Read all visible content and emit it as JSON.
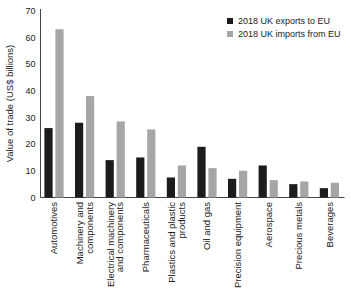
{
  "figure": {
    "ylabel": "Value of trade (US$ billions)"
  },
  "chart_data": {
    "type": "bar",
    "title": "",
    "xlabel": "",
    "ylabel": "Value of trade (US$ billions)",
    "ylim": [
      0,
      70
    ],
    "yticks": [
      0,
      10,
      20,
      30,
      40,
      50,
      60,
      70
    ],
    "grid": false,
    "legend_position": "top-right",
    "axis_color": "#444444",
    "text_color": "#222222",
    "categories": [
      "Automotives",
      "Machinery and components",
      "Electrical machinery and components",
      "Pharmaceuticals",
      "Plastics and plastic products",
      "Oil and gas",
      "Precision equipment",
      "Aerospace",
      "Precious metals",
      "Beverages"
    ],
    "category_label_lines": [
      [
        "Automotives"
      ],
      [
        "Machinery and",
        "components"
      ],
      [
        "Electrical machinery",
        "and components"
      ],
      [
        "Pharmaceuticals"
      ],
      [
        "Plastics and plastic",
        "products"
      ],
      [
        "Oil and gas"
      ],
      [
        "Precision equipment"
      ],
      [
        "Aerospace"
      ],
      [
        "Precious metals"
      ],
      [
        "Beverages"
      ]
    ],
    "series": [
      {
        "name": "2018 UK exports to EU",
        "color": "#1c1c1c",
        "values": [
          26,
          28,
          14,
          15,
          7.5,
          19,
          7,
          12,
          5,
          3.5
        ]
      },
      {
        "name": "2018 UK imports from EU",
        "color": "#a7a5a6",
        "values": [
          63,
          38,
          28.5,
          25.5,
          12,
          11,
          10,
          6.5,
          6,
          5.5
        ]
      }
    ]
  }
}
